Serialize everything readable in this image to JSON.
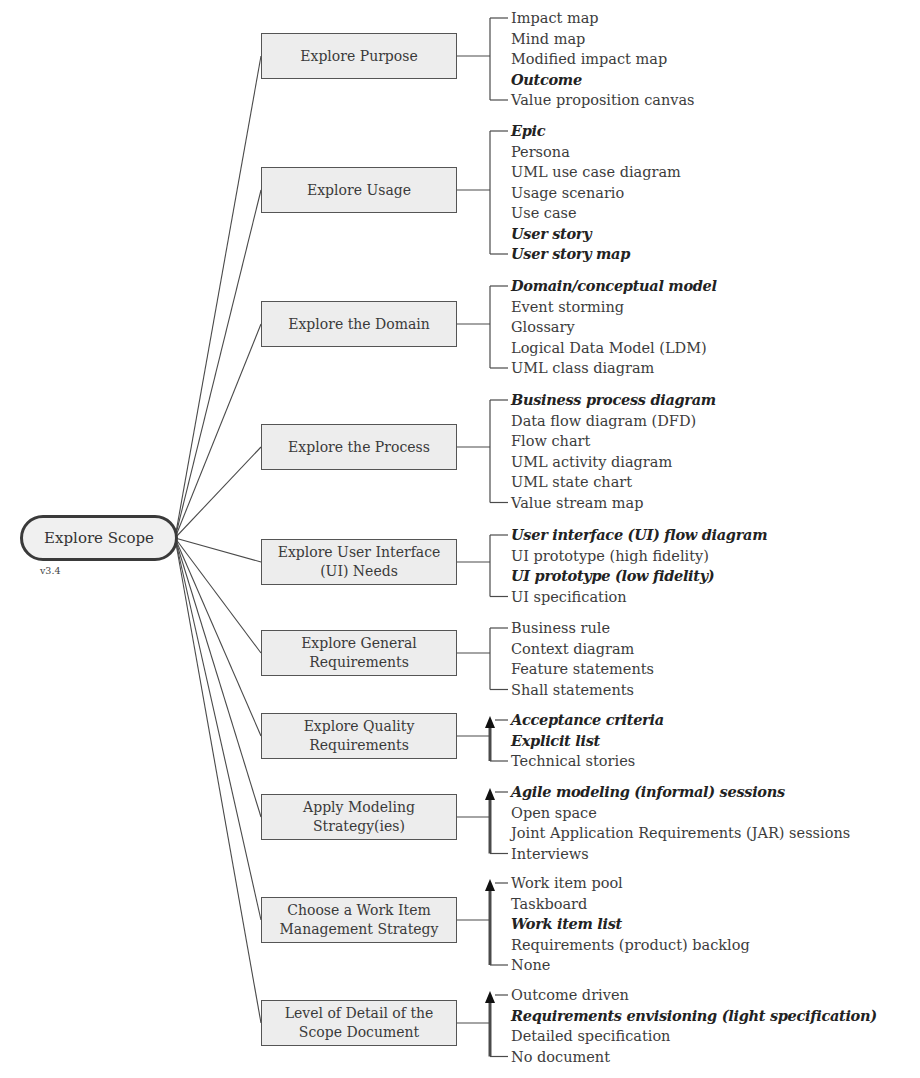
{
  "root": {
    "label": "Explore Scope",
    "version": "v3.4"
  },
  "colors": {
    "line": "#4a4a4a",
    "box_fill": "#ededed",
    "box_border": "#555555",
    "text": "#3c3c3c"
  },
  "nodes": [
    {
      "id": "explore-purpose",
      "label": "Explore Purpose",
      "box_top": 33,
      "ordered": false,
      "first_item_y": 18,
      "items": [
        {
          "label": "Impact map",
          "emphasis": false
        },
        {
          "label": "Mind map",
          "emphasis": false
        },
        {
          "label": "Modified impact map",
          "emphasis": false
        },
        {
          "label": "Outcome",
          "emphasis": true
        },
        {
          "label": "Value proposition canvas",
          "emphasis": false
        }
      ]
    },
    {
      "id": "explore-usage",
      "label": "Explore Usage",
      "box_top": 167,
      "ordered": false,
      "first_item_y": 131,
      "items": [
        {
          "label": "Epic",
          "emphasis": true
        },
        {
          "label": "Persona",
          "emphasis": false
        },
        {
          "label": "UML use case diagram",
          "emphasis": false
        },
        {
          "label": "Usage scenario",
          "emphasis": false
        },
        {
          "label": "Use case",
          "emphasis": false
        },
        {
          "label": "User story",
          "emphasis": true
        },
        {
          "label": "User story map",
          "emphasis": true
        }
      ]
    },
    {
      "id": "explore-domain",
      "label": "Explore the Domain",
      "box_top": 301,
      "ordered": false,
      "first_item_y": 286,
      "items": [
        {
          "label": "Domain/conceptual model",
          "emphasis": true
        },
        {
          "label": "Event storming",
          "emphasis": false
        },
        {
          "label": "Glossary",
          "emphasis": false
        },
        {
          "label": "Logical Data Model (LDM)",
          "emphasis": false
        },
        {
          "label": "UML class diagram",
          "emphasis": false
        }
      ]
    },
    {
      "id": "explore-process",
      "label": "Explore the Process",
      "box_top": 424,
      "ordered": false,
      "first_item_y": 400,
      "items": [
        {
          "label": "Business process diagram",
          "emphasis": true
        },
        {
          "label": "Data flow diagram (DFD)",
          "emphasis": false
        },
        {
          "label": "Flow chart",
          "emphasis": false
        },
        {
          "label": "UML activity diagram",
          "emphasis": false
        },
        {
          "label": "UML state chart",
          "emphasis": false
        },
        {
          "label": "Value stream map",
          "emphasis": false
        }
      ]
    },
    {
      "id": "explore-ui-needs",
      "label": "Explore User Interface (UI) Needs",
      "box_top": 539,
      "ordered": false,
      "first_item_y": 535,
      "items": [
        {
          "label": "User interface (UI) flow diagram",
          "emphasis": true
        },
        {
          "label": "UI prototype (high fidelity)",
          "emphasis": false
        },
        {
          "label": "UI prototype (low fidelity)",
          "emphasis": true
        },
        {
          "label": "UI specification",
          "emphasis": false
        }
      ]
    },
    {
      "id": "explore-general-requirements",
      "label": "Explore General Requirements",
      "box_top": 630,
      "ordered": false,
      "first_item_y": 628,
      "items": [
        {
          "label": "Business rule",
          "emphasis": false
        },
        {
          "label": "Context diagram",
          "emphasis": false
        },
        {
          "label": "Feature statements",
          "emphasis": false
        },
        {
          "label": "Shall statements",
          "emphasis": false
        }
      ]
    },
    {
      "id": "explore-quality-requirements",
      "label": "Explore Quality Requirements",
      "box_top": 713,
      "ordered": true,
      "first_item_y": 720,
      "items": [
        {
          "label": "Acceptance criteria",
          "emphasis": true
        },
        {
          "label": "Explicit list",
          "emphasis": true
        },
        {
          "label": "Technical stories",
          "emphasis": false
        }
      ]
    },
    {
      "id": "apply-modeling-strategies",
      "label": "Apply Modeling Strategy(ies)",
      "box_top": 794,
      "ordered": true,
      "first_item_y": 792,
      "items": [
        {
          "label": "Agile modeling (informal) sessions",
          "emphasis": true
        },
        {
          "label": "Open space",
          "emphasis": false
        },
        {
          "label": "Joint Application Requirements (JAR) sessions",
          "emphasis": false
        },
        {
          "label": "Interviews",
          "emphasis": false
        }
      ]
    },
    {
      "id": "work-item-management-strategy",
      "label": "Choose a Work Item Management Strategy",
      "box_top": 897,
      "ordered": true,
      "first_item_y": 883,
      "items": [
        {
          "label": "Work item pool",
          "emphasis": false
        },
        {
          "label": "Taskboard",
          "emphasis": false
        },
        {
          "label": "Work item list",
          "emphasis": true
        },
        {
          "label": "Requirements (product) backlog",
          "emphasis": false
        },
        {
          "label": "None",
          "emphasis": false
        }
      ]
    },
    {
      "id": "scope-document-detail",
      "label": "Level of Detail of the Scope Document",
      "box_top": 1000,
      "ordered": true,
      "first_item_y": 995,
      "items": [
        {
          "label": "Outcome driven",
          "emphasis": false
        },
        {
          "label": "Requirements envisioning (light specification)",
          "emphasis": true
        },
        {
          "label": "Detailed specification",
          "emphasis": false
        },
        {
          "label": "No document",
          "emphasis": false
        }
      ]
    }
  ]
}
